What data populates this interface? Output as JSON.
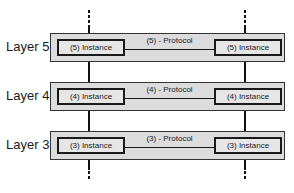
{
  "diagram": {
    "title": "",
    "layers": [
      {
        "label": "Layer 5",
        "left_instance": "(5) Instance",
        "protocol": "(5) - Protocol",
        "right_instance": "(5) Instance"
      },
      {
        "label": "Layer 4",
        "left_instance": "(4) Instance",
        "protocol": "(4) - Protocol",
        "right_instance": "(4) Instance"
      },
      {
        "label": "Layer 3",
        "left_instance": "(3) Instance",
        "protocol": "(3) - Protocol",
        "right_instance": "(3) Instance"
      }
    ],
    "continuation": {
      "top": "dotted",
      "bottom": "dotted"
    },
    "colors": {
      "layer_fill": "#dcdcdc",
      "instance_fill": "#e6e6e6",
      "stroke": "#1a1a1a"
    }
  }
}
